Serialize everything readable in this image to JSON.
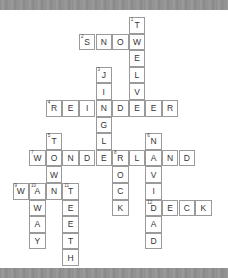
{
  "puzzle": {
    "origin_x": 12.5,
    "origin_y": 17,
    "cell_size": 16.6,
    "words": [
      {
        "number": "1",
        "word": "TWELVE",
        "direction": "down",
        "row": 0,
        "col": 7
      },
      {
        "number": "2",
        "word": "SNOW",
        "direction": "across",
        "row": 1,
        "col": 4
      },
      {
        "number": "3",
        "word": "JINGLE",
        "direction": "down",
        "row": 3,
        "col": 5
      },
      {
        "number": "4",
        "word": "REINDEER",
        "direction": "across",
        "row": 5,
        "col": 2
      },
      {
        "number": "5",
        "word": "TOW",
        "direction": "down",
        "row": 7,
        "col": 2
      },
      {
        "number": "6",
        "word": "NAVIDAD",
        "direction": "down",
        "row": 7,
        "col": 8
      },
      {
        "number": "7",
        "word": "WONDERLAND",
        "direction": "across",
        "row": 8,
        "col": 1
      },
      {
        "number": "8",
        "word": "ROCK",
        "direction": "down",
        "row": 8,
        "col": 6
      },
      {
        "number": "9",
        "word": "WANT",
        "direction": "across",
        "row": 10,
        "col": 0
      },
      {
        "number": "10",
        "word": "AWAY",
        "direction": "down",
        "row": 10,
        "col": 1
      },
      {
        "number": "11",
        "word": "TEETH",
        "direction": "down",
        "row": 10,
        "col": 3
      },
      {
        "number": "12",
        "word": "DECK",
        "direction": "across",
        "row": 11,
        "col": 8
      }
    ]
  },
  "colors": {
    "band": "#919191",
    "cell_border": "#9a9a9a",
    "letter": "#333333"
  }
}
